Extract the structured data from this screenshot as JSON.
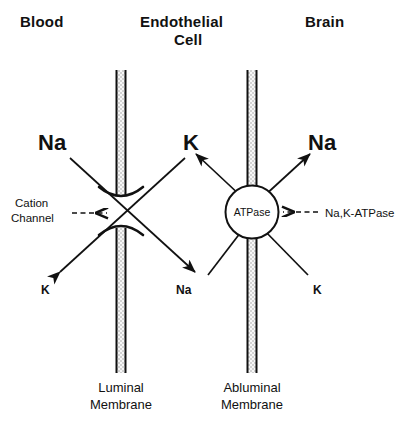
{
  "figure": {
    "title_regions": {
      "blood": "Blood",
      "endothelial_line1": "Endothelial",
      "endothelial_line2": "Cell",
      "brain": "Brain"
    },
    "colors": {
      "ink": "#111111",
      "membrane_fill": "#d8d8d8",
      "background": "#ffffff"
    },
    "membranes": [
      {
        "id": "luminal",
        "caption_line1": "Luminal",
        "caption_line2": "Membrane",
        "transporter": "cation-channel"
      },
      {
        "id": "abluminal",
        "caption_line1": "Abluminal",
        "caption_line2": "Membrane",
        "transporter": "na-k-atpase"
      }
    ],
    "transporters": {
      "cation_channel": {
        "annotation_line1": "Cation",
        "annotation_line2": "Channel",
        "pointer": "dashed-arrow-right"
      },
      "atpase": {
        "circle_label": "ATPase",
        "annotation": "Na,K-ATPase",
        "pointer": "dashed-arrow-left"
      }
    },
    "ions": {
      "luminal_blood_in": "Na",
      "luminal_cell_out": "K",
      "luminal_blood_out": "K",
      "luminal_cell_in": "Na",
      "abluminal_cell_in": "K",
      "abluminal_brain_out": "Na",
      "abluminal_cell_out": "Na",
      "abluminal_brain_in": "K"
    }
  }
}
